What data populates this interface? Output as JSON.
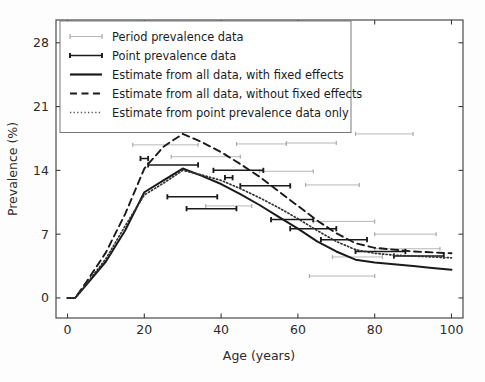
{
  "chart_data": {
    "type": "line",
    "title": "",
    "xlabel": "Age (years)",
    "ylabel": "Prevalence (%)",
    "xlim": [
      -3,
      103
    ],
    "ylim": [
      -2.2,
      30.5
    ],
    "xticks": [
      0,
      20,
      40,
      60,
      80,
      100
    ],
    "yticks": [
      0,
      7,
      14,
      21,
      28
    ],
    "grid": false,
    "legend_position": "upper left",
    "series": [
      {
        "name": "Estimate from all data, with fixed effects",
        "style": "solid",
        "color": "#1a1a1a",
        "x": [
          0,
          2,
          5,
          10,
          15,
          20,
          25,
          30,
          35,
          40,
          45,
          50,
          55,
          60,
          65,
          70,
          75,
          80,
          85,
          90,
          95,
          100
        ],
        "y": [
          0.0,
          0.0,
          1.5,
          4.0,
          7.4,
          11.6,
          12.9,
          14.2,
          13.4,
          12.5,
          11.4,
          10.2,
          8.9,
          7.6,
          6.2,
          5.1,
          4.2,
          3.9,
          3.7,
          3.5,
          3.3,
          3.1
        ]
      },
      {
        "name": "Estimate from all data, without fixed effects",
        "style": "dashed",
        "color": "#1a1a1a",
        "x": [
          0,
          2,
          5,
          10,
          15,
          20,
          25,
          30,
          35,
          40,
          45,
          50,
          55,
          60,
          65,
          70,
          75,
          80,
          85,
          90,
          95,
          100
        ],
        "y": [
          0.0,
          0.0,
          1.8,
          5.0,
          9.2,
          14.2,
          16.6,
          18.0,
          17.1,
          16.0,
          14.7,
          13.3,
          11.7,
          10.1,
          8.5,
          7.1,
          6.0,
          5.5,
          5.3,
          5.1,
          5.0,
          4.9
        ]
      },
      {
        "name": "Estimate from point prevalence data only",
        "style": "dotted",
        "color": "#333333",
        "x": [
          0,
          2,
          5,
          10,
          15,
          20,
          25,
          30,
          35,
          40,
          45,
          50,
          55,
          60,
          65,
          70,
          75,
          80,
          85,
          90,
          95,
          100
        ],
        "y": [
          0.0,
          0.0,
          1.6,
          4.3,
          7.9,
          11.3,
          12.6,
          14.0,
          13.5,
          12.9,
          12.0,
          11.0,
          9.9,
          8.7,
          7.4,
          6.2,
          5.3,
          4.9,
          4.7,
          4.6,
          4.5,
          4.4
        ]
      }
    ],
    "period_prevalence_data": {
      "name": "Period prevalence data",
      "color": "#aaaaaa",
      "intervals": [
        {
          "age_start": 17,
          "age_end": 34,
          "value": 16.8
        },
        {
          "age_start": 27,
          "age_end": 45,
          "value": 15.5
        },
        {
          "age_start": 44,
          "age_end": 57,
          "value": 16.9
        },
        {
          "age_start": 57,
          "age_end": 70,
          "value": 17.0
        },
        {
          "age_start": 75,
          "age_end": 90,
          "value": 18.0
        },
        {
          "age_start": 50,
          "age_end": 64,
          "value": 13.9
        },
        {
          "age_start": 62,
          "age_end": 76,
          "value": 12.4
        },
        {
          "age_start": 36,
          "age_end": 48,
          "value": 10.1
        },
        {
          "age_start": 64,
          "age_end": 80,
          "value": 8.4
        },
        {
          "age_start": 80,
          "age_end": 96,
          "value": 7.0
        },
        {
          "age_start": 80,
          "age_end": 97,
          "value": 5.4
        },
        {
          "age_start": 69,
          "age_end": 82,
          "value": 4.5
        },
        {
          "age_start": 63,
          "age_end": 80,
          "value": 2.4
        }
      ]
    },
    "point_prevalence_data": {
      "name": "Point prevalence data",
      "color": "#1a1a1a",
      "intervals": [
        {
          "age_start": 21,
          "age_end": 34,
          "value": 14.6
        },
        {
          "age_start": 38,
          "age_end": 51,
          "value": 14.0
        },
        {
          "age_start": 45,
          "age_end": 58,
          "value": 12.3
        },
        {
          "age_start": 26,
          "age_end": 39,
          "value": 11.1
        },
        {
          "age_start": 31,
          "age_end": 44,
          "value": 9.8
        },
        {
          "age_start": 53,
          "age_end": 64,
          "value": 8.6
        },
        {
          "age_start": 58,
          "age_end": 70,
          "value": 7.6
        },
        {
          "age_start": 66,
          "age_end": 78,
          "value": 6.4
        },
        {
          "age_start": 75,
          "age_end": 88,
          "value": 5.1
        },
        {
          "age_start": 85,
          "age_end": 98,
          "value": 4.6
        },
        {
          "age_start": 19,
          "age_end": 21,
          "value": 15.3
        },
        {
          "age_start": 41,
          "age_end": 43,
          "value": 13.2
        }
      ]
    }
  },
  "legend": {
    "items": [
      {
        "label": "Period prevalence data",
        "marker": "errorbar-light"
      },
      {
        "label": "Point prevalence data",
        "marker": "errorbar-dark"
      },
      {
        "label": "Estimate from all data, with fixed effects",
        "marker": "solid-line"
      },
      {
        "label": "Estimate from all data, without fixed effects",
        "marker": "dashed-line"
      },
      {
        "label": "Estimate from point prevalence data only",
        "marker": "dotted-line"
      }
    ]
  }
}
